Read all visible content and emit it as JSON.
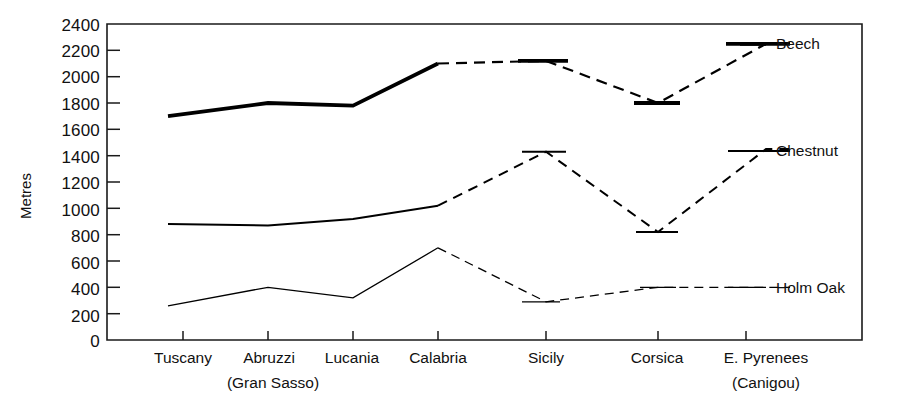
{
  "chart_data": {
    "type": "line",
    "title": "",
    "subtitle": "",
    "xlabel": "",
    "ylabel": "Metres",
    "ylim": [
      0,
      2400
    ],
    "ytick_step": 200,
    "yticks": [
      0,
      200,
      400,
      600,
      800,
      1000,
      1200,
      1400,
      1600,
      1800,
      2000,
      2200,
      2400
    ],
    "ytick_labels": [
      "0",
      "200",
      "400",
      "600",
      "800",
      "1000",
      "1200",
      "1400",
      "1600",
      "1800",
      "2000",
      "2200",
      "2400"
    ],
    "grid": false,
    "legend_position": "right-inline",
    "categories": [
      "Tuscany",
      "Abruzzi",
      "Lucania",
      "Calabria",
      "Sicily",
      "Corsica",
      "E. Pyrenees"
    ],
    "category_sublabels": [
      "",
      "(Gran Sasso)",
      "",
      "",
      "",
      "",
      "(Canigou)"
    ],
    "series": [
      {
        "name": "Beech",
        "values": [
          1700,
          1800,
          1780,
          2100,
          2120,
          1800,
          2250
        ],
        "line_style": "solid-with-dashed-links",
        "line_width": 3.6,
        "color": "#000000"
      },
      {
        "name": "Chestnut",
        "values": [
          880,
          870,
          920,
          1020,
          1430,
          820,
          1450
        ],
        "line_style": "solid-with-dashed-links",
        "line_width": 2.0,
        "color": "#000000"
      },
      {
        "name": "Holm Oak",
        "values": [
          260,
          400,
          320,
          700,
          290,
          400,
          400
        ],
        "line_style": "solid-with-dashed-links",
        "line_width": 1.3,
        "color": "#000000"
      }
    ]
  },
  "legend": {
    "entries": [
      {
        "label": "Beech"
      },
      {
        "label": "Chestnut"
      },
      {
        "label": "Holm Oak"
      }
    ]
  },
  "axis": {
    "y_title": "Metres"
  }
}
